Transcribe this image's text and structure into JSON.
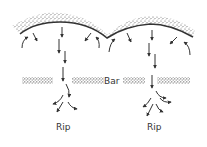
{
  "diagram": {
    "labels": {
      "bar": "Bar",
      "rip_left": "Rip",
      "rip_right": "Rip"
    },
    "elements": {
      "shoreline": "scalloped beach with two cusps",
      "sandbar": "offshore bar with gaps at rip channels",
      "arrows": "longshore feeder currents converging into seaward rip currents"
    },
    "colors": {
      "ink": "#333333",
      "sand": "#555555",
      "background": "#ffffff"
    }
  }
}
